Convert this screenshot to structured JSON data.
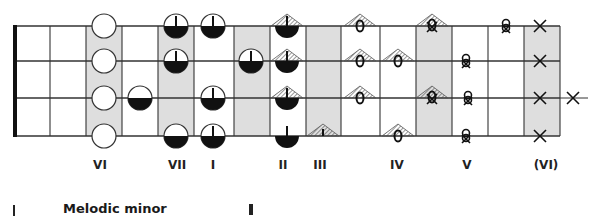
{
  "diagram": {
    "title": "Melodic minor",
    "colors": {
      "line": "#333333",
      "shade": "#dedede",
      "fill": "#111111",
      "background": "#ffffff"
    },
    "fret_lines_x": [
      18,
      50,
      86,
      122,
      158,
      194,
      234,
      270,
      306,
      341,
      380,
      416,
      452,
      488,
      524,
      560
    ],
    "string_lines_y": [
      26,
      61,
      98,
      136
    ],
    "nut_x": 15,
    "shaded_columns": [
      {
        "x1": 86,
        "x2": 122
      },
      {
        "x1": 158,
        "x2": 194
      },
      {
        "x1": 234,
        "x2": 270
      },
      {
        "x1": 306,
        "x2": 341
      },
      {
        "x1": 416,
        "x2": 452
      },
      {
        "x1": 524,
        "x2": 560
      }
    ],
    "markers": [
      {
        "type": "open-circle",
        "x": 104,
        "y": 26
      },
      {
        "type": "open-circle",
        "x": 104,
        "y": 61
      },
      {
        "type": "open-circle",
        "x": 104,
        "y": 98
      },
      {
        "type": "open-circle",
        "x": 104,
        "y": 136
      },
      {
        "type": "half-circle",
        "x": 140,
        "y": 98
      },
      {
        "type": "half-circle-stem",
        "x": 176,
        "y": 26
      },
      {
        "type": "half-circle-stem",
        "x": 176,
        "y": 61
      },
      {
        "type": "half-circle",
        "x": 176,
        "y": 136
      },
      {
        "type": "half-circle-stem",
        "x": 213,
        "y": 26
      },
      {
        "type": "half-circle-stem",
        "x": 213,
        "y": 98
      },
      {
        "type": "half-circle-stem",
        "x": 213,
        "y": 136
      },
      {
        "type": "half-circle-stem",
        "x": 251,
        "y": 61
      },
      {
        "type": "tent-half-circle",
        "x": 287,
        "y": 26
      },
      {
        "type": "tent-half-circle",
        "x": 287,
        "y": 61
      },
      {
        "type": "tent-half-circle",
        "x": 287,
        "y": 98
      },
      {
        "type": "half-disc-stem",
        "x": 287,
        "y": 136
      },
      {
        "type": "tent-stem",
        "x": 323,
        "y": 136
      },
      {
        "type": "tent-o",
        "x": 360,
        "y": 26
      },
      {
        "type": "tent-o",
        "x": 360,
        "y": 61
      },
      {
        "type": "tent-o",
        "x": 360,
        "y": 98
      },
      {
        "type": "tent-o",
        "x": 398,
        "y": 61
      },
      {
        "type": "tent-o",
        "x": 398,
        "y": 136
      },
      {
        "type": "tent-ox",
        "x": 432,
        "y": 26
      },
      {
        "type": "tent-ox",
        "x": 432,
        "y": 98
      },
      {
        "type": "knot",
        "x": 466,
        "y": 61
      },
      {
        "type": "knot",
        "x": 468,
        "y": 98
      },
      {
        "type": "knot",
        "x": 466,
        "y": 136
      },
      {
        "type": "knot",
        "x": 506,
        "y": 26
      },
      {
        "type": "x",
        "x": 540,
        "y": 26
      },
      {
        "type": "x",
        "x": 540,
        "y": 61
      },
      {
        "type": "x",
        "x": 540,
        "y": 98
      },
      {
        "type": "x",
        "x": 540,
        "y": 136
      },
      {
        "type": "x",
        "x": 573,
        "y": 98
      }
    ],
    "degree_labels": [
      {
        "text": "VI",
        "x": 100
      },
      {
        "text": "VII",
        "x": 177
      },
      {
        "text": "I",
        "x": 213
      },
      {
        "text": "II",
        "x": 283
      },
      {
        "text": "III",
        "x": 320
      },
      {
        "text": "IV",
        "x": 397
      },
      {
        "text": "V",
        "x": 467
      },
      {
        "text": "(VI)",
        "x": 546
      }
    ]
  },
  "labels": {
    "deg0": "VI",
    "deg1": "VII",
    "deg2": "I",
    "deg3": "II",
    "deg4": "III",
    "deg5": "IV",
    "deg6": "V",
    "deg7": "(VI)"
  },
  "caption": {
    "title": "Melodic minor"
  }
}
